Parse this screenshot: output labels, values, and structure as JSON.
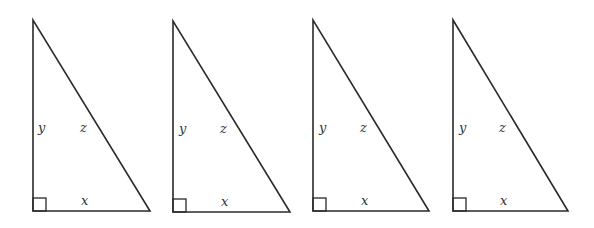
{
  "diagram": {
    "type": "right-triangles",
    "count": 4,
    "triangles": [
      {
        "id": 1,
        "top": [
          33,
          20
        ],
        "corner": [
          33,
          211
        ],
        "right": [
          150,
          211
        ],
        "labels": {
          "y": "y",
          "z": "z",
          "x": "x"
        }
      },
      {
        "id": 2,
        "top": [
          173,
          21
        ],
        "corner": [
          173,
          212
        ],
        "right": [
          290,
          212
        ],
        "labels": {
          "y": "y",
          "z": "z",
          "x": "x"
        }
      },
      {
        "id": 3,
        "top": [
          313,
          20
        ],
        "corner": [
          313,
          211
        ],
        "right": [
          429,
          211
        ],
        "labels": {
          "y": "y",
          "z": "z",
          "x": "x"
        }
      },
      {
        "id": 4,
        "top": [
          453,
          20
        ],
        "corner": [
          453,
          211
        ],
        "right": [
          568,
          211
        ],
        "labels": {
          "y": "y",
          "z": "z",
          "x": "x"
        }
      }
    ],
    "right_angle_marker_size": 13,
    "colors": {
      "stroke": "#2a2a2a",
      "label": "#333333",
      "background": "#ffffff"
    }
  }
}
